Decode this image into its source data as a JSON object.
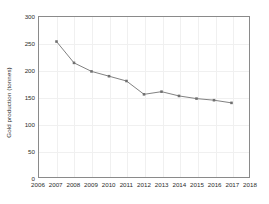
{
  "chart_data": {
    "type": "line",
    "title": "",
    "xlabel": "",
    "ylabel": "Gold production (tonnes)",
    "x": [
      2007,
      2008,
      2009,
      2010,
      2011,
      2012,
      2013,
      2014,
      2015,
      2016,
      2017
    ],
    "values": [
      254,
      214,
      198,
      189,
      180,
      155,
      160,
      152,
      147,
      144,
      139
    ],
    "series": [
      {
        "name": "Gold production",
        "values": [
          254,
          214,
          198,
          189,
          180,
          155,
          160,
          152,
          147,
          144,
          139
        ]
      }
    ],
    "xlim": [
      2006,
      2018
    ],
    "ylim": [
      0,
      300
    ],
    "x_ticks": [
      "2006",
      "2007",
      "2008",
      "2009",
      "2010",
      "2011",
      "2012",
      "2013",
      "2014",
      "2015",
      "2016",
      "2017",
      "2018"
    ],
    "x_tick_values": [
      2006,
      2007,
      2008,
      2009,
      2010,
      2011,
      2012,
      2013,
      2014,
      2015,
      2016,
      2017,
      2018
    ],
    "y_ticks": [
      "0",
      "50",
      "100",
      "150",
      "200",
      "250",
      "300"
    ],
    "y_tick_values": [
      0,
      50,
      100,
      150,
      200,
      250,
      300
    ],
    "grid": true,
    "legend": "none",
    "line_color": "#808080",
    "marker_color": "#707070",
    "marker": "square",
    "frame_color": "#8a8a8a",
    "grid_color": "#f0f0f0",
    "text_color": "#2b2b2b",
    "background": "#ffffff"
  }
}
